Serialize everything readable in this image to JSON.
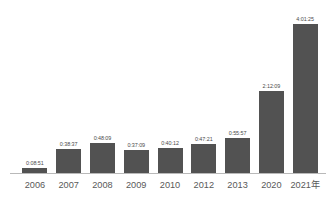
{
  "chart_data": {
    "type": "bar",
    "title": "",
    "subtitle": "",
    "xlabel": "",
    "ylabel": "",
    "grid": false,
    "legend": false,
    "axis_unit_label": "年",
    "categories": [
      "2006",
      "2007",
      "2008",
      "2009",
      "2010",
      "2012",
      "2013",
      "2020",
      "2021年"
    ],
    "value_labels": [
      "0:08:51",
      "0:38:37",
      "0:48:09",
      "0:37:09",
      "0:40:12",
      "0:47:21",
      "0:55:57",
      "2:12:09",
      "4:01:25"
    ],
    "values_seconds": [
      531,
      2317,
      2889,
      2229,
      2412,
      2841,
      3357,
      7929,
      14485
    ],
    "ylim": [
      0,
      14485
    ],
    "series": [
      {
        "name": "duration",
        "values": [
          531,
          2317,
          2889,
          2229,
          2412,
          2841,
          3357,
          7929,
          14485
        ]
      }
    ],
    "bar_color": "#525252",
    "axis_color": "#b9b9b9",
    "label_color": "#595959",
    "value_label_color": "#4a4a4a"
  }
}
